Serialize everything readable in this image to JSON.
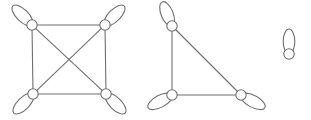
{
  "figure": {
    "background_color": "#ffffff",
    "stroke_color": "#6f6f6f",
    "vertex_fill_color": "#ffffff",
    "stroke_width": 1.1,
    "width": 311,
    "height": 120
  },
  "components": [
    {
      "id": "component-1",
      "name": "complete-graph-k4-with-loops",
      "label": "K4 with a loop at each vertex",
      "vertex_count": 4,
      "edge_count": 6,
      "loop_count": 4
    },
    {
      "id": "component-2",
      "name": "triangle-graph-with-loops",
      "label": "K3 (triangle) with a loop at each vertex",
      "vertex_count": 3,
      "edge_count": 3,
      "loop_count": 3
    },
    {
      "id": "component-3",
      "name": "isolated-vertex-with-loop",
      "label": "Single vertex with one loop",
      "vertex_count": 1,
      "edge_count": 0,
      "loop_count": 1
    }
  ],
  "vertices": [
    {
      "id": "v1",
      "component": "component-1",
      "name": "vertex-k4-top-left",
      "cx": 32,
      "cy": 25,
      "r": 5.2,
      "loop_angle": 225
    },
    {
      "id": "v2",
      "component": "component-1",
      "name": "vertex-k4-top-right",
      "cx": 105,
      "cy": 25,
      "r": 5.2,
      "loop_angle": 315
    },
    {
      "id": "v3",
      "component": "component-1",
      "name": "vertex-k4-bottom-left",
      "cx": 33,
      "cy": 94,
      "r": 5.2,
      "loop_angle": 135
    },
    {
      "id": "v4",
      "component": "component-1",
      "name": "vertex-k4-bottom-right",
      "cx": 106,
      "cy": 94,
      "r": 5.2,
      "loop_angle": 45
    },
    {
      "id": "v5",
      "component": "component-2",
      "name": "vertex-tri-top",
      "cx": 172,
      "cy": 26,
      "r": 5.2,
      "loop_angle": 248
    },
    {
      "id": "v6",
      "component": "component-2",
      "name": "vertex-tri-bottom-left",
      "cx": 172,
      "cy": 95,
      "r": 5.2,
      "loop_angle": 152
    },
    {
      "id": "v7",
      "component": "component-2",
      "name": "vertex-tri-bottom-right",
      "cx": 241,
      "cy": 95,
      "r": 5.2,
      "loop_angle": 28
    },
    {
      "id": "v8",
      "component": "component-3",
      "name": "vertex-isolated",
      "cx": 289,
      "cy": 54,
      "r": 5.2,
      "loop_angle": 270
    }
  ],
  "edges": [
    {
      "name": "edge-k4-top",
      "from": "v1",
      "to": "v2"
    },
    {
      "name": "edge-k4-left",
      "from": "v1",
      "to": "v3"
    },
    {
      "name": "edge-k4-right",
      "from": "v2",
      "to": "v4"
    },
    {
      "name": "edge-k4-bottom",
      "from": "v3",
      "to": "v4"
    },
    {
      "name": "edge-k4-diagonal-tlbr",
      "from": "v1",
      "to": "v4"
    },
    {
      "name": "edge-k4-diagonal-trbl",
      "from": "v2",
      "to": "v3"
    },
    {
      "name": "edge-tri-left",
      "from": "v5",
      "to": "v6"
    },
    {
      "name": "edge-tri-hypotenuse",
      "from": "v5",
      "to": "v7"
    },
    {
      "name": "edge-tri-bottom",
      "from": "v6",
      "to": "v7"
    }
  ],
  "loops": [
    {
      "name": "loop-k4-top-left",
      "vertex": "v1",
      "rx": 13.5,
      "ry": 6.0,
      "angle": 225
    },
    {
      "name": "loop-k4-top-right",
      "vertex": "v2",
      "rx": 13.5,
      "ry": 6.0,
      "angle": 315
    },
    {
      "name": "loop-k4-bottom-left",
      "vertex": "v3",
      "rx": 13.5,
      "ry": 6.0,
      "angle": 135
    },
    {
      "name": "loop-k4-bottom-right",
      "vertex": "v4",
      "rx": 13.5,
      "ry": 6.0,
      "angle": 45
    },
    {
      "name": "loop-tri-top",
      "vertex": "v5",
      "rx": 13.0,
      "ry": 6.0,
      "angle": 248
    },
    {
      "name": "loop-tri-bottom-left",
      "vertex": "v6",
      "rx": 13.5,
      "ry": 6.0,
      "angle": 152
    },
    {
      "name": "loop-tri-bottom-right",
      "vertex": "v7",
      "rx": 13.5,
      "ry": 6.0,
      "angle": 28
    },
    {
      "name": "loop-isolated",
      "vertex": "v8",
      "rx": 12.5,
      "ry": 5.8,
      "angle": 270
    }
  ]
}
